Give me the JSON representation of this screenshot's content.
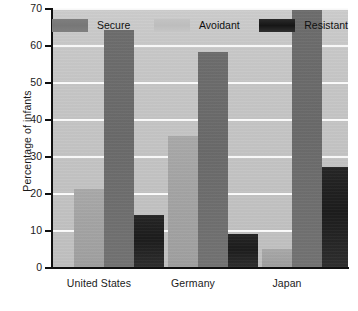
{
  "chart_data": {
    "type": "bar",
    "title": "",
    "xlabel": "",
    "ylabel": "Percentage of infants",
    "ylim": [
      0,
      70
    ],
    "yticks": [
      0,
      10,
      20,
      30,
      40,
      50,
      60,
      70
    ],
    "ytick_labels": [
      "0",
      "10",
      "20",
      "30",
      "40",
      "50",
      "60",
      "70"
    ],
    "grid": true,
    "grid_orientation": "horizontal",
    "legend_position": "top-inside",
    "categories": [
      "United States",
      "Germany",
      "Japan"
    ],
    "series": [
      {
        "name": "Secure",
        "color": "#a4a4a4",
        "values": [
          21,
          35.5,
          5
        ]
      },
      {
        "name": "Avoidant",
        "color": "#6a6a6a",
        "values": [
          64,
          58,
          69.5
        ]
      },
      {
        "name": "Resistant",
        "color": "#1c1c1c",
        "values": [
          14,
          9,
          27
        ]
      }
    ]
  },
  "legend": {
    "entries": [
      {
        "label": "Secure",
        "swatch": "legend-swatch-secure"
      },
      {
        "label": "Avoidant",
        "swatch": "legend-swatch-avoidant"
      },
      {
        "label": "Resistant",
        "swatch": "legend-swatch-resistant"
      }
    ]
  },
  "axes": {
    "y_title": "Percentage of infants",
    "y_labels": [
      "70",
      "60",
      "50",
      "40",
      "30",
      "20",
      "10",
      "0"
    ],
    "x_labels": [
      "United States",
      "Germany",
      "Japan"
    ]
  },
  "colors": {
    "plot_background": "#c5c5c5",
    "gridline": "#fbfbfb",
    "axis": "#101010",
    "text": "#1a1a1a",
    "secure": "#a4a4a4",
    "avoidant": "#6a6a6a",
    "resistant": "#1c1c1c"
  }
}
